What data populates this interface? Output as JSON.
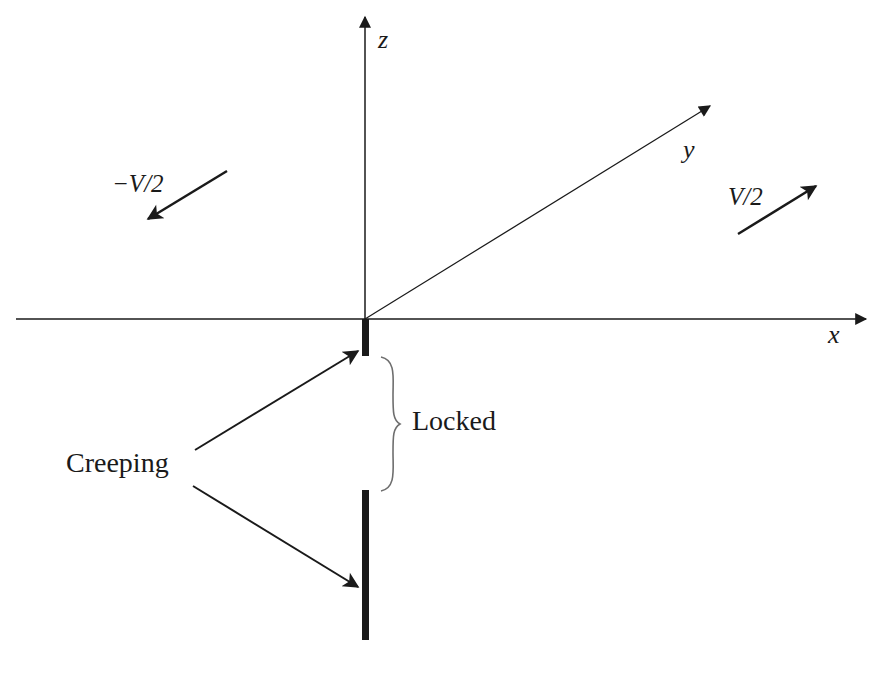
{
  "axes": {
    "x_label": "x",
    "y_label": "y",
    "z_label": "z"
  },
  "velocities": {
    "left_label": "−V/2",
    "right_label": "V/2"
  },
  "annotations": {
    "creeping_label": "Creeping",
    "locked_label": "Locked"
  },
  "colors": {
    "line": "#1a1a1a",
    "brace": "#6e6e6e",
    "background": "#ffffff"
  }
}
